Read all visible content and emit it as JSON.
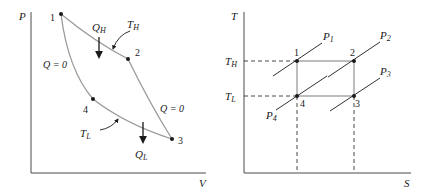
{
  "pv_diagram": {
    "y_axis_label": "P",
    "x_axis_label": "V",
    "points": [
      {
        "label": "1",
        "x": 61,
        "y": 14
      },
      {
        "label": "2",
        "x": 128,
        "y": 59
      },
      {
        "label": "3",
        "x": 172,
        "y": 139
      },
      {
        "label": "4",
        "x": 93,
        "y": 99
      }
    ],
    "heat_in": {
      "main": "Q",
      "sub": "H"
    },
    "heat_out": {
      "main": "Q",
      "sub": "L"
    },
    "hot_isotherm": {
      "main": "T",
      "sub": "H"
    },
    "cold_isotherm": {
      "main": "T",
      "sub": "L"
    },
    "adiabat_left_label": "Q = 0",
    "adiabat_right_label": "Q = 0"
  },
  "ts_diagram": {
    "y_axis_label": "T",
    "x_axis_label": "S",
    "t_high": {
      "main": "T",
      "sub": "H"
    },
    "t_low": {
      "main": "T",
      "sub": "L"
    },
    "points": [
      {
        "label": "1",
        "x": 297,
        "y": 61
      },
      {
        "label": "2",
        "x": 354,
        "y": 61
      },
      {
        "label": "3",
        "x": 354,
        "y": 96
      },
      {
        "label": "4",
        "x": 297,
        "y": 96
      }
    ],
    "isobars": [
      {
        "main": "P",
        "sub": "1"
      },
      {
        "main": "P",
        "sub": "2"
      },
      {
        "main": "P",
        "sub": "3"
      },
      {
        "main": "P",
        "sub": "4"
      }
    ]
  },
  "colors": {
    "axis": "#4a4a4a",
    "curve": "#9a9a9a",
    "ink": "#1a1a1a"
  }
}
